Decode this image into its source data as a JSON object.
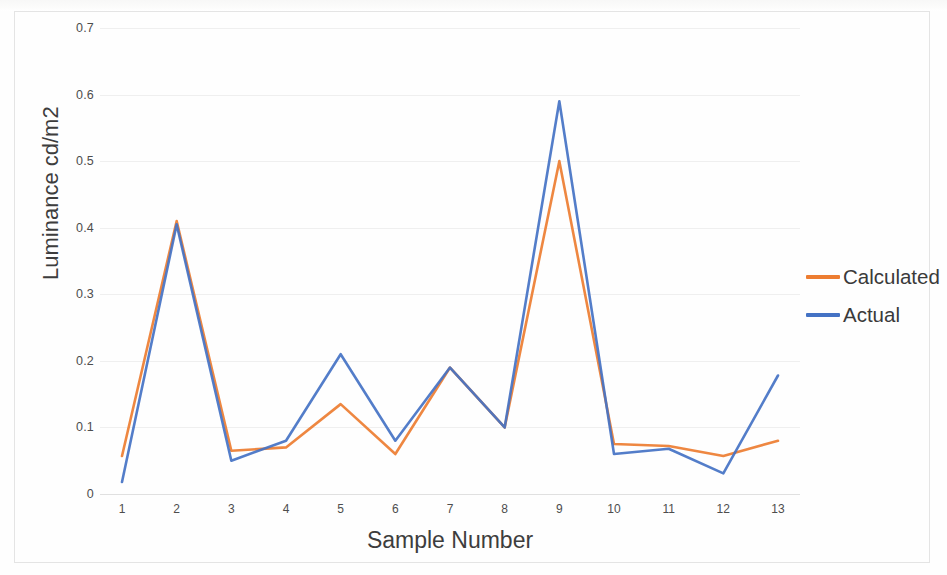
{
  "chart_data": {
    "type": "line",
    "title": "",
    "xlabel": "Sample Number",
    "ylabel": "Luminance cd/m2",
    "categories": [
      "1",
      "2",
      "3",
      "4",
      "5",
      "6",
      "7",
      "8",
      "9",
      "10",
      "11",
      "12",
      "13"
    ],
    "x": [
      1,
      2,
      3,
      4,
      5,
      6,
      7,
      8,
      9,
      10,
      11,
      12,
      13
    ],
    "series": [
      {
        "name": "Calculated",
        "color": "#ED7D31",
        "values": [
          0.057,
          0.41,
          0.065,
          0.07,
          0.135,
          0.06,
          0.19,
          0.1,
          0.5,
          0.075,
          0.072,
          0.057,
          0.08
        ]
      },
      {
        "name": "Actual",
        "color": "#4472C4",
        "values": [
          0.018,
          0.405,
          0.05,
          0.08,
          0.21,
          0.08,
          0.19,
          0.1,
          0.59,
          0.06,
          0.068,
          0.031,
          0.178
        ]
      }
    ],
    "ylim": [
      0,
      0.7
    ],
    "yticks": [
      0,
      0.1,
      0.2,
      0.3,
      0.4,
      0.5,
      0.6,
      0.7
    ],
    "ytick_labels": [
      "0",
      "0.1",
      "0.2",
      "0.3",
      "0.4",
      "0.5",
      "0.6",
      "0.7"
    ],
    "xlim": [
      1,
      13
    ],
    "grid": "horizontal",
    "legend_position": "right"
  },
  "legend": {
    "items": [
      {
        "label": "Calculated",
        "color": "#ED7D31"
      },
      {
        "label": "Actual",
        "color": "#4472C4"
      }
    ]
  },
  "axes": {
    "x_title": "Sample Number",
    "y_title": "Luminance cd/m2"
  }
}
